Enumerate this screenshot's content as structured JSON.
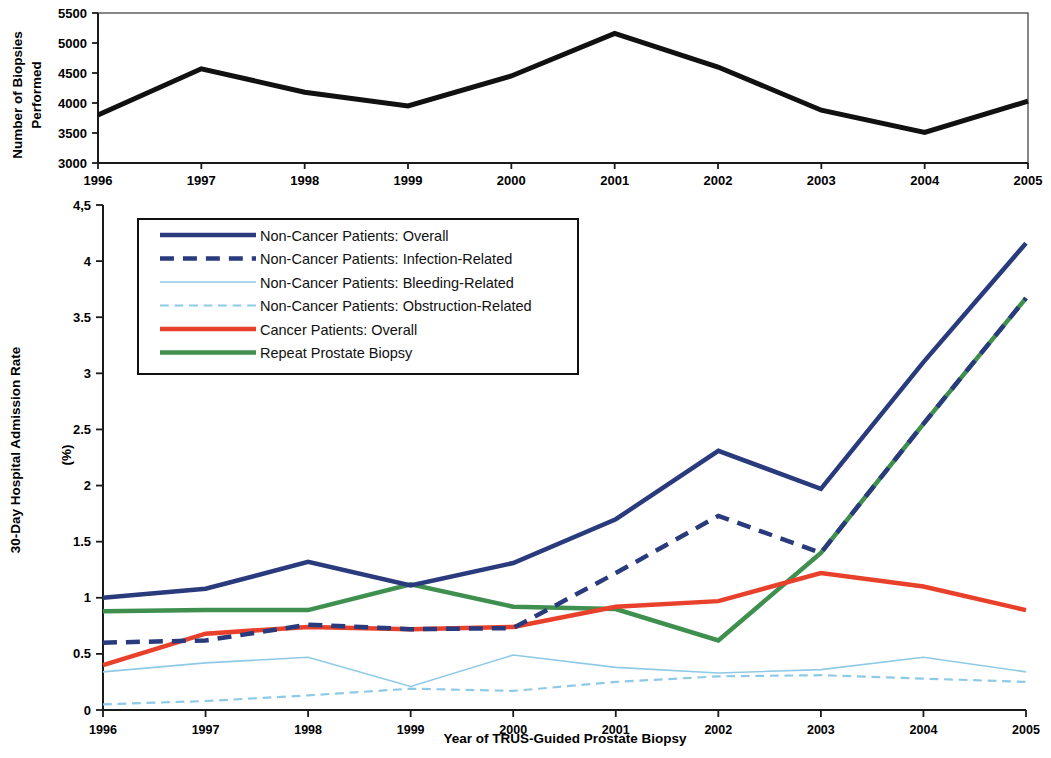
{
  "figure": {
    "title": "",
    "x_axis_label": "Year of TRUS-Guided Prostate Biopsy",
    "categories": [
      "1996",
      "1997",
      "1998",
      "1999",
      "2000",
      "2001",
      "2002",
      "2003",
      "2004",
      "2005"
    ]
  },
  "top_panel": {
    "y_axis_label_line1": "Number of Biopsies",
    "y_axis_label_line2": "Performed",
    "y_ticks": [
      "3000",
      "3500",
      "4000",
      "4500",
      "5000",
      "5500"
    ],
    "x_ticks": [
      "1996",
      "1997",
      "1998",
      "1999",
      "2000",
      "2001",
      "2002",
      "2003",
      "2004",
      "2005"
    ],
    "series_color": "#111111"
  },
  "bottom_panel": {
    "y_axis_label_line1": "30-Day Hospital Admission Rate",
    "y_axis_label_line2": "(%)",
    "y_ticks": [
      "0",
      "0.5",
      "1",
      "1.5",
      "2",
      "2.5",
      "3",
      "3.5",
      "4",
      "4,5"
    ],
    "x_ticks": [
      "1996",
      "1997",
      "1998",
      "1999",
      "2000",
      "2001",
      "2002",
      "2003",
      "2004",
      "2005"
    ]
  },
  "legend": {
    "items": [
      {
        "label": "Non-Cancer Patients: Overall",
        "color": "#2a3b7d",
        "style": "solid",
        "width": 4.5
      },
      {
        "label": "Non-Cancer Patients: Infection-Related",
        "color": "#2a3b7d",
        "style": "dashed",
        "width": 4.5
      },
      {
        "label": "Non-Cancer Patients: Bleeding-Related",
        "color": "#8ecae6",
        "style": "solid",
        "width": 1.6
      },
      {
        "label": "Non-Cancer Patients: Obstruction-Related",
        "color": "#8ecae6",
        "style": "dashed",
        "width": 2.2
      },
      {
        "label": "Cancer Patients: Overall",
        "color": "#e8402a",
        "style": "solid",
        "width": 4.5
      },
      {
        "label": "Repeat Prostate Biopsy",
        "color": "#3f8f4f",
        "style": "solid",
        "width": 4.5
      }
    ]
  },
  "chart_data": [
    {
      "type": "line",
      "title": "Number of Biopsies Performed by Year",
      "xlabel": "",
      "ylabel": "Number of Biopsies Performed",
      "x": [
        "1996",
        "1997",
        "1998",
        "1999",
        "2000",
        "2001",
        "2002",
        "2003",
        "2004",
        "2005"
      ],
      "xlim": [
        "1996",
        "2005"
      ],
      "ylim": [
        3000,
        5500
      ],
      "ytick_step": 500,
      "grid": false,
      "legend_position": "none",
      "series": [
        {
          "name": "Number of Biopsies Performed",
          "color": "#111111",
          "style": "solid",
          "values": [
            3800,
            4570,
            4180,
            3950,
            4450,
            5160,
            4600,
            3880,
            3510,
            4030
          ]
        }
      ]
    },
    {
      "type": "line",
      "title": "30-Day Hospital Admission Rate by Year",
      "xlabel": "Year of TRUS-Guided Prostate Biopsy",
      "ylabel": "30-Day Hospital Admission Rate (%)",
      "x": [
        "1996",
        "1997",
        "1998",
        "1999",
        "2000",
        "2001",
        "2002",
        "2003",
        "2004",
        "2005"
      ],
      "xlim": [
        "1996",
        "2005"
      ],
      "ylim": [
        0,
        4.5
      ],
      "ytick_step": 0.5,
      "grid": false,
      "legend_position": "upper left",
      "series": [
        {
          "name": "Non-Cancer Patients: Overall",
          "color": "#2a3b7d",
          "style": "solid",
          "width": 4.5,
          "values": [
            1.0,
            1.08,
            1.32,
            1.11,
            1.31,
            1.7,
            2.31,
            1.97,
            3.1,
            4.16
          ]
        },
        {
          "name": "Non-Cancer Patients: Infection-Related",
          "color": "#2a3b7d",
          "style": "dashed",
          "width": 4.5,
          "values": [
            0.6,
            0.62,
            0.76,
            0.72,
            0.73,
            1.22,
            1.73,
            1.4,
            2.55,
            3.67
          ]
        },
        {
          "name": "Non-Cancer Patients: Bleeding-Related",
          "color": "#8ecae6",
          "style": "solid",
          "width": 1.6,
          "values": [
            0.34,
            0.42,
            0.47,
            0.21,
            0.49,
            0.38,
            0.33,
            0.36,
            0.47,
            0.34
          ]
        },
        {
          "name": "Non-Cancer Patients: Obstruction-Related",
          "color": "#8ecae6",
          "style": "dashed",
          "width": 2.2,
          "values": [
            0.05,
            0.08,
            0.13,
            0.19,
            0.17,
            0.25,
            0.3,
            0.31,
            0.28,
            0.25
          ]
        },
        {
          "name": "Cancer Patients: Overall",
          "color": "#e8402a",
          "style": "solid",
          "width": 4.5,
          "values": [
            0.4,
            0.68,
            0.74,
            0.72,
            0.74,
            0.92,
            0.97,
            1.22,
            1.1,
            0.89
          ]
        },
        {
          "name": "Repeat Prostate Biopsy",
          "color": "#3f8f4f",
          "style": "solid",
          "width": 4.5,
          "values": [
            0.88,
            0.89,
            0.89,
            1.12,
            0.92,
            0.9,
            0.62,
            1.4,
            2.55,
            3.67
          ]
        }
      ]
    }
  ]
}
